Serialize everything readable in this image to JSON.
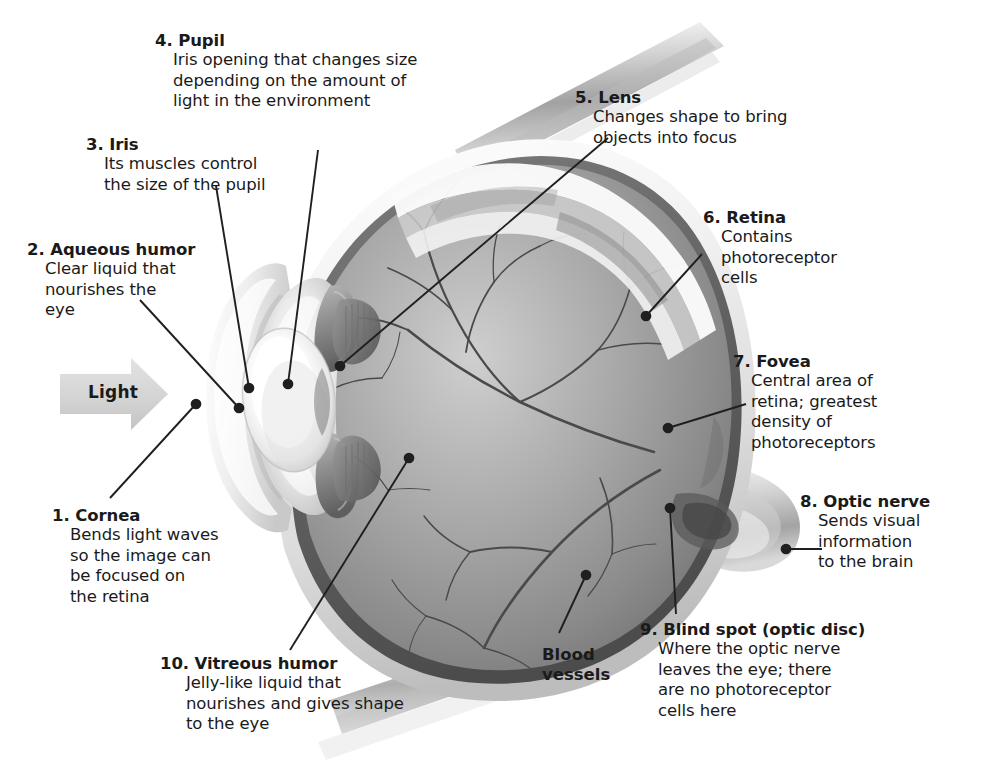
{
  "diagram": {
    "title": "Structure of the human eye (cross-section)",
    "light_arrow_label": "Light",
    "colors": {
      "text": "#1a1a1a",
      "leader_line": "#1f1f1f",
      "light_arrow_fill": "#d6d6d6",
      "sclera_white": "#f4f4f4",
      "vitreous_gray": "#8e8e8e",
      "lens_white": "#fbfbfb",
      "background": "#ffffff"
    }
  },
  "labels": [
    {
      "number": "1.",
      "title": "Cornea",
      "lines": [
        "Bends light waves",
        "so the image can",
        "be focused on",
        "the retina"
      ]
    },
    {
      "number": "2.",
      "title": "Aqueous humor",
      "lines": [
        "Clear liquid that",
        "nourishes the",
        "eye"
      ]
    },
    {
      "number": "3.",
      "title": "Iris",
      "lines": [
        "Its muscles control",
        "the size of the pupil"
      ]
    },
    {
      "number": "4.",
      "title": "Pupil",
      "lines": [
        "Iris opening that changes size",
        "depending on the amount of",
        "light in the environment"
      ]
    },
    {
      "number": "5.",
      "title": "Lens",
      "lines": [
        "Changes shape to bring",
        "objects into focus"
      ]
    },
    {
      "number": "6.",
      "title": "Retina",
      "lines": [
        "Contains",
        "photoreceptor",
        "cells"
      ]
    },
    {
      "number": "7.",
      "title": "Fovea",
      "lines": [
        "Central area of",
        "retina; greatest",
        "density of",
        "photoreceptors"
      ]
    },
    {
      "number": "8.",
      "title": "Optic nerve",
      "lines": [
        "Sends visual",
        "information",
        "to the brain"
      ]
    },
    {
      "number": "9.",
      "title": "Blind spot (optic disc)",
      "lines": [
        "Where the optic nerve",
        "leaves the eye; there",
        "are no photoreceptor",
        "cells here"
      ]
    },
    {
      "number": "10.",
      "title": "Vitreous humor",
      "lines": [
        "Jelly-like liquid that",
        "nourishes and gives shape",
        "to the eye"
      ]
    }
  ],
  "plain_labels": [
    {
      "name": "blood-vessels",
      "lines": [
        "Blood",
        "vessels"
      ]
    }
  ]
}
